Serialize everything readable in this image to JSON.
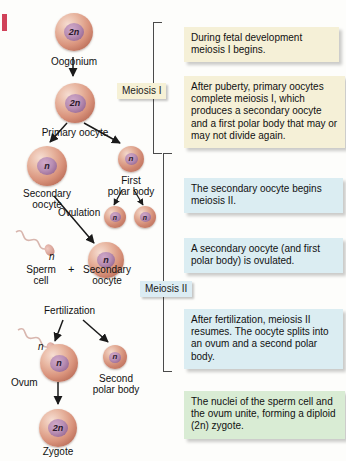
{
  "figure": {
    "colors": {
      "note_cream": "#f5f0d7",
      "note_blue": "#dbedf2",
      "note_green": "#d9ecd4",
      "cell_outer": "#d9937c",
      "cell_nucleus": "#b98fb4",
      "arrow": "#1a1a1a",
      "bracket": "#4a4a4a",
      "scan_mark": "#c8203c"
    }
  },
  "cells": [
    {
      "id": "oogonium",
      "ploidy": "2n",
      "label": "Oogonium"
    },
    {
      "id": "primary-oocyte",
      "ploidy": "2n",
      "label": "Primary oocyte"
    },
    {
      "id": "secondary-oocyte",
      "ploidy": "n",
      "label": "Secondary\noocyte"
    },
    {
      "id": "first-polar-body",
      "ploidy": "n",
      "label": "First\npolar body"
    },
    {
      "id": "polar-body-split-a",
      "ploidy": "n",
      "label": ""
    },
    {
      "id": "polar-body-split-b",
      "ploidy": "n",
      "label": ""
    },
    {
      "id": "sperm-cell",
      "ploidy": "n",
      "label": "Sperm\ncell"
    },
    {
      "id": "secondary-oocyte-2",
      "ploidy": "n",
      "label": "Secondary\noocyte"
    },
    {
      "id": "ovum",
      "ploidy": "n",
      "label": "Ovum"
    },
    {
      "id": "second-polar-body",
      "ploidy": "n",
      "label": "Second\npolar body"
    },
    {
      "id": "zygote",
      "ploidy": "2n",
      "label": "Zygote"
    }
  ],
  "labels": {
    "oogonium": "Oogonium",
    "primary_oocyte": "Primary oocyte",
    "secondary_oocyte_line1": "Secondary",
    "secondary_oocyte_line2": "oocyte",
    "first_polar_body_line1": "First",
    "first_polar_body_line2": "polar body",
    "ovulation": "Ovulation",
    "sperm_cell_line1": "Sperm",
    "sperm_cell_line2": "cell",
    "plus": "+",
    "secondary_oocyte2_line1": "Secondary",
    "secondary_oocyte2_line2": "oocyte",
    "fertilization": "Fertilization",
    "ovum": "Ovum",
    "second_polar_body_line1": "Second",
    "second_polar_body_line2": "polar body",
    "zygote": "Zygote",
    "ploidy_2n": "2n",
    "ploidy_n": "n"
  },
  "stages": [
    {
      "id": "meiosis-1",
      "label": "Meiosis I",
      "style": "cream"
    },
    {
      "id": "meiosis-2",
      "label": "Meiosis II",
      "style": "blue"
    }
  ],
  "notes": [
    {
      "id": "note-fetal-development",
      "style": "cream",
      "text": "During fetal development meiosis I begins."
    },
    {
      "id": "note-after-puberty",
      "style": "cream",
      "text": "After puberty, primary oocytes complete meiosis I, which produces a secondary oocyte and a first polar body that may or may not divide again."
    },
    {
      "id": "note-begins-meiosis-2",
      "style": "blue",
      "text": "The secondary oocyte begins meiosis II."
    },
    {
      "id": "note-ovulated",
      "style": "blue",
      "text": "A secondary oocyte (and first polar body) is ovulated."
    },
    {
      "id": "note-after-fertilization",
      "style": "blue",
      "text": "After fertilization, meiosis II resumes. The oocyte splits into an ovum and a second polar body."
    },
    {
      "id": "note-nuclei-unite",
      "style": "green",
      "text": "The nuclei of the sperm cell and the ovum unite, forming a diploid (2n) zygote."
    }
  ]
}
